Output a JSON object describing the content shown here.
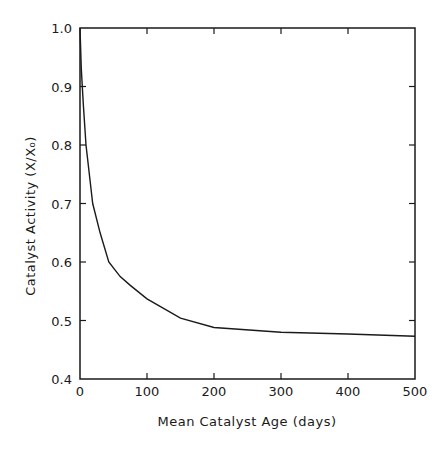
{
  "chart_data": {
    "type": "line",
    "title": "",
    "xlabel": "Mean Catalyst Age (days)",
    "ylabel": "Catalyst Activity (X/X₀)",
    "xlim": [
      0,
      500
    ],
    "ylim": [
      0.4,
      1.0
    ],
    "xticks": [
      0,
      100,
      200,
      300,
      400,
      500
    ],
    "yticks": [
      0.4,
      0.5,
      0.6,
      0.7,
      0.8,
      0.9,
      1.0
    ],
    "xtick_labels": [
      "0",
      "100",
      "200",
      "300",
      "400",
      "500"
    ],
    "ytick_labels": [
      "0.4",
      "0.5",
      "0.6",
      "0.7",
      "0.8",
      "0.9",
      "1.0"
    ],
    "grid": false,
    "legend": null,
    "series": [
      {
        "name": "Catalyst Activity",
        "color": "#1a1a1a",
        "x": [
          0,
          2,
          5,
          9,
          19,
          30,
          43,
          60,
          75,
          100,
          150,
          200,
          300,
          400,
          500
        ],
        "y": [
          1.0,
          0.93,
          0.87,
          0.8,
          0.7,
          0.65,
          0.6,
          0.575,
          0.56,
          0.537,
          0.504,
          0.488,
          0.48,
          0.477,
          0.473
        ]
      }
    ]
  }
}
